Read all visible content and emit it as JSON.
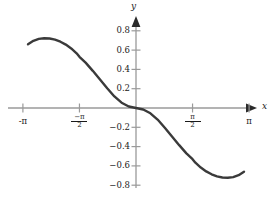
{
  "chart_data": {
    "type": "line",
    "title": "",
    "subtitle": "",
    "xlabel": "x",
    "ylabel": "y",
    "xlim": [
      -3.4,
      3.6
    ],
    "ylim": [
      -0.92,
      0.92
    ],
    "grid": false,
    "legend": null,
    "background": "#ffffff",
    "curve_color": "#3a3a3a",
    "axis_color": "#9a9a9a",
    "text_color": "#1a1a1a",
    "x_ticks": [
      {
        "value": -3.141592653589793,
        "label": "-π",
        "kind": "plain"
      },
      {
        "value": -1.5707963267948966,
        "label": "-π/2",
        "kind": "fraction",
        "numerator": "−π",
        "denominator": "2"
      },
      {
        "value": 1.5707963267948966,
        "label": "π/2",
        "kind": "fraction",
        "numerator": "π",
        "denominator": "2"
      },
      {
        "value": 3.141592653589793,
        "label": "π",
        "kind": "plain"
      }
    ],
    "y_ticks": [
      {
        "value": 0.8,
        "label": "0.8"
      },
      {
        "value": 0.6,
        "label": "0.6"
      },
      {
        "value": 0.4,
        "label": "0.4"
      },
      {
        "value": 0.2,
        "label": "0.2"
      },
      {
        "value": -0.2,
        "label": "−0.2"
      },
      {
        "value": -0.4,
        "label": "−0.4"
      },
      {
        "value": -0.6,
        "label": "−0.6"
      },
      {
        "value": -0.8,
        "label": "−0.8"
      }
    ],
    "series": [
      {
        "name": "curve",
        "x": [
          -3.0,
          -2.85,
          -2.7,
          -2.55,
          -2.4,
          -2.25,
          -2.1,
          -1.95,
          -1.8,
          -1.65,
          -1.5708,
          -1.4,
          -1.2,
          -1.0,
          -0.8,
          -0.6,
          -0.4,
          -0.2,
          0.0,
          0.2,
          0.4,
          0.6,
          0.8,
          1.0,
          1.2,
          1.4,
          1.5708,
          1.65,
          1.8,
          1.95,
          2.1,
          2.25,
          2.4,
          2.55,
          2.7,
          2.85,
          3.0
        ],
        "y": [
          0.66,
          0.696,
          0.716,
          0.723,
          0.72,
          0.708,
          0.687,
          0.657,
          0.617,
          0.567,
          0.53,
          0.47,
          0.385,
          0.295,
          0.205,
          0.12,
          0.055,
          0.015,
          0.0,
          -0.015,
          -0.055,
          -0.12,
          -0.205,
          -0.295,
          -0.385,
          -0.47,
          -0.53,
          -0.567,
          -0.617,
          -0.657,
          -0.687,
          -0.708,
          -0.72,
          -0.723,
          -0.716,
          -0.696,
          -0.66
        ]
      }
    ],
    "annotations": {
      "maximum": {
        "x": -2.45,
        "y": 0.723
      },
      "minimum": {
        "x": 2.45,
        "y": -0.723
      },
      "origin_crossing": {
        "x": 0,
        "y": 0
      }
    },
    "axis_arrows": {
      "x": "right",
      "y": "up"
    }
  }
}
